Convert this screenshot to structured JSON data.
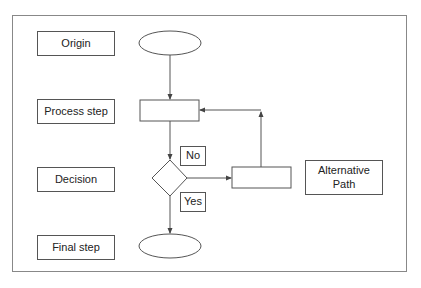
{
  "diagram": {
    "type": "flowchart",
    "legend_labels": [
      {
        "id": "origin",
        "label": "Origin"
      },
      {
        "id": "process",
        "label": "Process step"
      },
      {
        "id": "decision",
        "label": "Decision"
      },
      {
        "id": "final",
        "label": "Final step"
      }
    ],
    "alternative_label": "Alternative Path",
    "branch_labels": {
      "no": "No",
      "yes": "Yes"
    },
    "shapes": [
      {
        "id": "start",
        "kind": "ellipse"
      },
      {
        "id": "process",
        "kind": "rectangle"
      },
      {
        "id": "decision",
        "kind": "diamond"
      },
      {
        "id": "alternative",
        "kind": "rectangle"
      },
      {
        "id": "end",
        "kind": "ellipse"
      }
    ],
    "edges": [
      {
        "from": "start",
        "to": "process"
      },
      {
        "from": "process",
        "to": "decision"
      },
      {
        "from": "decision",
        "to": "alternative",
        "label": "No"
      },
      {
        "from": "alternative",
        "to": "process"
      },
      {
        "from": "decision",
        "to": "end",
        "label": "Yes"
      }
    ],
    "colors": {
      "stroke": "#555555",
      "frame": "#888888",
      "text": "#222222"
    }
  }
}
